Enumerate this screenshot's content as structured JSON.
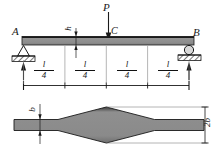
{
  "figure": {
    "type": "engineering-beam-diagram",
    "colors": {
      "beam_fill": "#8a8a8a",
      "beam_edge": "#1a1a1a",
      "line": "#1a1a1a",
      "hatch": "#4d4d4d",
      "background": "#ffffff"
    }
  },
  "elevation": {
    "load": {
      "label": "P",
      "point_label": "C",
      "direction": "down"
    },
    "supports": {
      "left": {
        "label": "A",
        "type": "pin"
      },
      "right": {
        "label": "B",
        "type": "roller"
      }
    },
    "depth_label": "h",
    "dimensions": {
      "segments": [
        {
          "num": "l",
          "den": "4"
        },
        {
          "num": "l",
          "den": "4"
        },
        {
          "num": "l",
          "den": "4"
        },
        {
          "num": "l",
          "den": "4"
        }
      ]
    }
  },
  "plan": {
    "width_end_label": "b",
    "width_mid_label": "2b",
    "shape": "lens"
  }
}
